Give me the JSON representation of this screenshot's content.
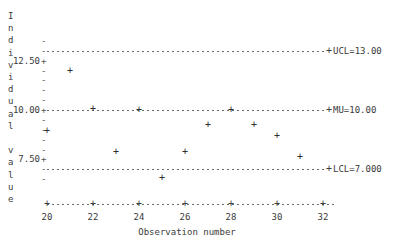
{
  "chart_data": {
    "type": "scatter",
    "title": "",
    "xlabel": "Observation number",
    "ylabel": "Individual value",
    "x": [
      20,
      21,
      22,
      23,
      24,
      25,
      26,
      27,
      28,
      29,
      30,
      31
    ],
    "values": [
      8.95,
      11.95,
      10.05,
      7.85,
      10.0,
      6.55,
      7.85,
      9.25,
      10.0,
      9.25,
      8.7,
      7.6
    ],
    "xlim": [
      19.4,
      32.6
    ],
    "ylim": [
      6.3,
      13.6
    ],
    "xticks": [
      20,
      22,
      24,
      26,
      28,
      30,
      32
    ],
    "xtick_labels": [
      "20",
      "22",
      "24",
      "26",
      "28",
      "30",
      "32"
    ],
    "yticks": [
      7.5,
      10.0,
      12.5
    ],
    "ytick_labels": [
      "7.50",
      "10.00",
      "12.50"
    ],
    "grid": false,
    "legend": "none",
    "point_marker": "+",
    "reference_lines": [
      {
        "name": "UCL",
        "label": "UCL=13.00",
        "value": 13.0
      },
      {
        "name": "MU",
        "label": "MU=10.00",
        "value": 10.0
      },
      {
        "name": "LCL",
        "label": "LCL=7.000",
        "value": 7.0
      }
    ],
    "annotations": []
  },
  "axes": {
    "y_caption_letters": [
      "I",
      "n",
      "d",
      "i",
      "v",
      "i",
      "d",
      "u",
      "a",
      "l",
      "",
      "v",
      "a",
      "l",
      "u",
      "e"
    ],
    "y_tick_labels": [
      "12.50",
      "10.00",
      "7.50"
    ],
    "x_tick_labels": [
      "20",
      "22",
      "24",
      "26",
      "28",
      "30",
      "32"
    ],
    "x_title": "Observation number"
  },
  "limits": {
    "ucl_label": "UCL=13.00",
    "mu_label": "MU=10.00",
    "lcl_label": "LCL=7.000"
  },
  "marks": {
    "tick_minor": "-",
    "tick_major": "+",
    "point": "+"
  }
}
